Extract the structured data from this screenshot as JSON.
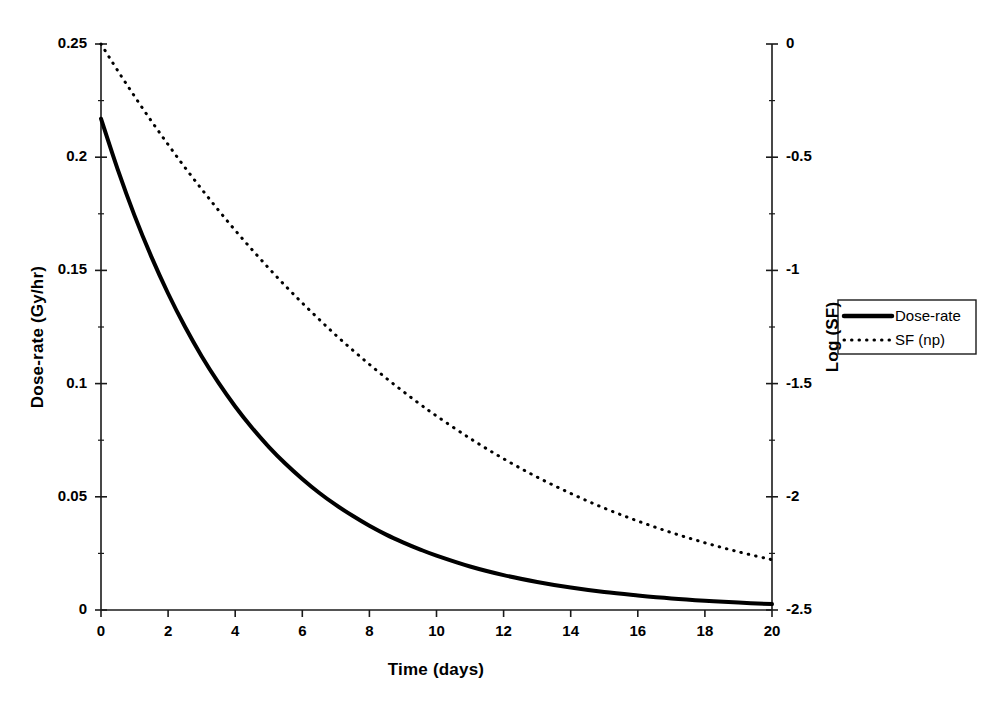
{
  "chart_data": {
    "type": "line",
    "title": "",
    "xlabel": "Time (days)",
    "ylabel": "Dose-rate (Gy/hr)",
    "y2label": "Log (SF)",
    "xlim": [
      0,
      20
    ],
    "ylim": [
      0,
      0.25
    ],
    "y2lim": [
      -2.5,
      0
    ],
    "grid": false,
    "legend_position": "right-upper",
    "x_ticks": [
      0,
      2,
      4,
      6,
      8,
      10,
      12,
      14,
      16,
      18,
      20
    ],
    "x_tick_labels": [
      "0",
      "2",
      "4",
      "6",
      "8",
      "10",
      "12",
      "14",
      "16",
      "18",
      "20"
    ],
    "y_ticks": [
      0,
      0.05,
      0.1,
      0.15,
      0.2,
      0.25
    ],
    "y_tick_labels": [
      "0",
      "0.05",
      "0.1",
      "0.15",
      "0.2",
      "0.25"
    ],
    "y2_ticks": [
      -2.5,
      -2,
      -1.5,
      -1,
      -0.5,
      0
    ],
    "y2_tick_labels": [
      "-2.5",
      "-2",
      "-1.5",
      "-1",
      "-0.5",
      "0"
    ],
    "x": [
      0,
      0.5,
      1,
      1.5,
      2,
      2.5,
      3,
      3.5,
      4,
      4.5,
      5,
      5.5,
      6,
      6.5,
      7,
      7.5,
      8,
      8.5,
      9,
      9.5,
      10,
      11,
      12,
      13,
      14,
      15,
      16,
      17,
      18,
      19,
      20
    ],
    "series": [
      {
        "name": "Dose-rate",
        "axis": "left",
        "style": "solid",
        "color": "#000000",
        "width": 4,
        "values": [
          0.217,
          0.1945,
          0.1742,
          0.1561,
          0.1398,
          0.1252,
          0.1121,
          0.1004,
          0.0899,
          0.0805,
          0.0721,
          0.0646,
          0.0579,
          0.0518,
          0.0464,
          0.0416,
          0.0372,
          0.0333,
          0.0299,
          0.0268,
          0.024,
          0.0192,
          0.0154,
          0.0124,
          0.0099,
          0.0079,
          0.0064,
          0.0051,
          0.0041,
          0.0033,
          0.0026
        ]
      },
      {
        "name": "SF (np)",
        "axis": "right",
        "style": "dotted",
        "color": "#000000",
        "width": 3,
        "values": [
          0,
          -0.118,
          -0.231,
          -0.34,
          -0.444,
          -0.545,
          -0.641,
          -0.734,
          -0.823,
          -0.908,
          -0.99,
          -1.069,
          -1.144,
          -1.216,
          -1.286,
          -1.352,
          -1.415,
          -1.476,
          -1.534,
          -1.59,
          -1.643,
          -1.742,
          -1.832,
          -1.913,
          -1.985,
          -2.05,
          -2.107,
          -2.158,
          -2.203,
          -2.243,
          -2.278
        ]
      }
    ],
    "legend": [
      {
        "label": "Dose-rate",
        "style": "solid"
      },
      {
        "label": "SF (np)",
        "style": "dotted"
      }
    ]
  }
}
